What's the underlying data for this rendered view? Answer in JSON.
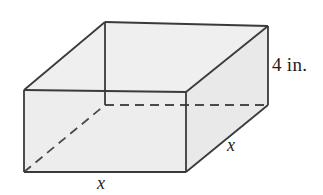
{
  "figure": {
    "kind": "rectangular-prism-diagram",
    "caption": "Rectangular prism with square base of side x and height 4 in.",
    "colors": {
      "background": "#ffffff",
      "face_fill": "#ededed",
      "top_face_fill": "#efefef",
      "right_face_fill": "#e9e9e9",
      "edge_stroke": "#3a3a3a",
      "hidden_edge_stroke": "#4a4a4a",
      "label_color": "#1d1d1d"
    },
    "stroke_width": 1.8,
    "hidden_dash_pattern": "9 6",
    "labels": {
      "height": "4 in.",
      "width": "x",
      "depth": "x"
    },
    "geometry": {
      "front_top_left": [
        24,
        90
      ],
      "front_top_right": [
        186,
        92
      ],
      "front_bottom_right": [
        186,
        172
      ],
      "front_bottom_left": [
        24,
        172
      ],
      "back_top_left": [
        105,
        22
      ],
      "back_top_right": [
        268,
        26
      ],
      "back_bottom_right": [
        268,
        105
      ],
      "back_bottom_left": [
        105,
        105
      ]
    }
  }
}
